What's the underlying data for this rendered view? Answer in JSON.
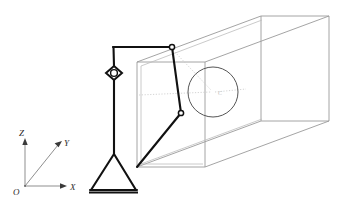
{
  "figure": {
    "background_color": "#ffffff",
    "width": 343,
    "height": 216
  },
  "colors": {
    "linkage_stroke": "#111111",
    "frame_stroke": "#9a9a9a",
    "frame_stroke_light": "#bdbdbd",
    "axis_stroke": "#5a5a5a",
    "axis_ray_stroke": "#8f8f8f",
    "detail_circle_stroke": "#555555",
    "guide_dotted": "#c8c8c8",
    "label_fill": "#2b2b2b",
    "detail_label_fill": "#b9b9b9"
  },
  "axes": {
    "name": "coordinate-triad",
    "origin": {
      "x": 25,
      "y": 186
    },
    "labels": {
      "origin": "O",
      "z": "Z",
      "y": "Y",
      "x": "X"
    },
    "label_positions": {
      "origin": {
        "x": 14,
        "y": 194
      },
      "z": {
        "x": 20,
        "y": 134
      },
      "y": {
        "x": 65,
        "y": 146
      },
      "x": {
        "x": 71,
        "y": 190
      }
    },
    "rays": [
      {
        "name": "z-axis",
        "from": {
          "x": 25,
          "y": 186
        },
        "to": {
          "x": 25,
          "y": 141
        },
        "arrow": true
      },
      {
        "name": "y-axis",
        "from": {
          "x": 25,
          "y": 186
        },
        "to": {
          "x": 61,
          "y": 142
        },
        "arrow": true
      },
      {
        "name": "x-axis",
        "from": {
          "x": 25,
          "y": 186
        },
        "to": {
          "x": 66,
          "y": 186
        },
        "arrow": true
      }
    ]
  },
  "frame": {
    "name": "rectangular-channel-frame",
    "description": "Open rectangular prism drawn in oblique projection, receding to the upper right",
    "front_face": [
      {
        "x": 137,
        "y": 62
      },
      {
        "x": 137,
        "y": 167
      },
      {
        "x": 205,
        "y": 167
      },
      {
        "x": 205,
        "y": 62
      }
    ],
    "back_face": [
      {
        "x": 261,
        "y": 16
      },
      {
        "x": 261,
        "y": 121
      },
      {
        "x": 329,
        "y": 121
      },
      {
        "x": 329,
        "y": 16
      }
    ],
    "connectors": [
      {
        "from": {
          "x": 137,
          "y": 62
        },
        "to": {
          "x": 261,
          "y": 16
        }
      },
      {
        "from": {
          "x": 137,
          "y": 167
        },
        "to": {
          "x": 261,
          "y": 121
        }
      },
      {
        "from": {
          "x": 205,
          "y": 167
        },
        "to": {
          "x": 329,
          "y": 121
        }
      },
      {
        "from": {
          "x": 205,
          "y": 62
        },
        "to": {
          "x": 329,
          "y": 16
        }
      }
    ],
    "inner_wall_offsets": [
      {
        "from": {
          "x": 141,
          "y": 66
        },
        "to": {
          "x": 141,
          "y": 165
        }
      },
      {
        "from": {
          "x": 141,
          "y": 165
        },
        "to": {
          "x": 203,
          "y": 165
        }
      }
    ]
  },
  "linkage": {
    "name": "four-bar-linkage",
    "stroke_width": 2.1,
    "nodes": [
      {
        "id": "A",
        "name": "top-left-corner",
        "x": 113,
        "y": 47
      },
      {
        "id": "B",
        "name": "top-pin-joint",
        "x": 172,
        "y": 47
      },
      {
        "id": "C",
        "name": "mid-pin-joint",
        "x": 181,
        "y": 113
      },
      {
        "id": "D",
        "name": "lower-anchor",
        "x": 137,
        "y": 167
      },
      {
        "id": "E",
        "name": "slider-diamond-joint",
        "x": 114,
        "y": 73
      },
      {
        "id": "F",
        "name": "base-apex",
        "x": 114,
        "y": 154
      }
    ],
    "segments": [
      {
        "name": "top-horizontal-bar",
        "from": "A",
        "to": "B"
      },
      {
        "name": "upper-coupler-bar",
        "from": "B",
        "to": "C"
      },
      {
        "name": "lower-coupler-bar",
        "from": "C",
        "to": "D"
      },
      {
        "name": "vertical-column",
        "from": "A",
        "to": "F"
      }
    ],
    "pin_joints": [
      {
        "name": "pin-joint-top",
        "x": 172,
        "y": 47,
        "r": 2.6
      },
      {
        "name": "pin-joint-mid",
        "x": 181,
        "y": 113,
        "r": 2.6
      }
    ],
    "diamond_joint": {
      "name": "diamond-slider-joint",
      "center": {
        "x": 114,
        "y": 73
      },
      "half_width": 8,
      "half_height": 7,
      "inner_circle_r": 3.4
    },
    "base_triangle": {
      "name": "triangular-support-base",
      "apex": {
        "x": 114,
        "y": 154
      },
      "left": {
        "x": 91,
        "y": 190
      },
      "right": {
        "x": 136,
        "y": 190
      },
      "ground_bar": {
        "from": {
          "x": 89,
          "y": 192
        },
        "to": {
          "x": 138,
          "y": 192
        }
      }
    }
  },
  "detail": {
    "name": "detail-callout-circle",
    "center": {
      "x": 213,
      "y": 92
    },
    "radius": 25,
    "label": "C",
    "label_position": {
      "x": 218,
      "y": 95
    },
    "guide_lines": [
      {
        "from": {
          "x": 172,
          "y": 49
        },
        "to": {
          "x": 213,
          "y": 92
        }
      },
      {
        "from": {
          "x": 139,
          "y": 95
        },
        "to": {
          "x": 213,
          "y": 92
        }
      },
      {
        "from": {
          "x": 213,
          "y": 92
        },
        "to": {
          "x": 244,
          "y": 89
        }
      }
    ]
  }
}
